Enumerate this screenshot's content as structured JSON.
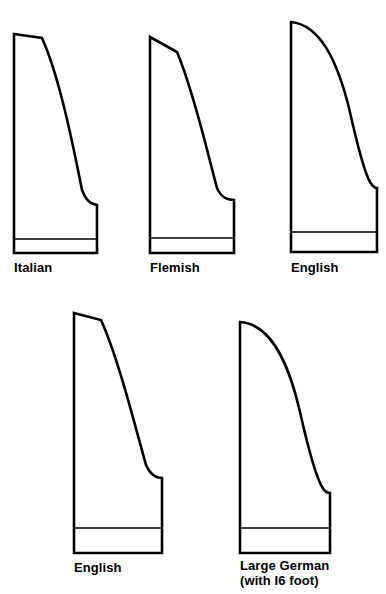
{
  "figure": {
    "background_color": "#ffffff",
    "stroke_color": "#000000",
    "fill_color": "#ffffff",
    "width": 386,
    "height": 594
  },
  "shapes": [
    {
      "id": "italian",
      "label": "Italian",
      "label_line2": "",
      "row": 1,
      "column": 1,
      "label_x": 14,
      "label_y": 272,
      "outline_path": "M 14 34 L 42 38 C 60 78 74 150 82 190 C 86 200 90 204 97 205 L 97 253 L 14 253 Z",
      "keyboard_line": {
        "x1": 14,
        "y1": 239,
        "x2": 97,
        "y2": 239
      },
      "bounds": {
        "left": 14,
        "top": 34,
        "right": 97,
        "bottom": 253
      }
    },
    {
      "id": "flemish",
      "label": "Flemish",
      "label_line2": "",
      "row": 1,
      "column": 2,
      "label_x": 150,
      "label_y": 272,
      "outline_path": "M 150 37 L 177 52 C 194 92 208 155 217 188 C 221 197 226 200 234 200 L 234 253 L 150 253 Z",
      "keyboard_line": {
        "x1": 150,
        "y1": 238,
        "x2": 234,
        "y2": 238
      },
      "bounds": {
        "left": 150,
        "top": 37,
        "right": 234,
        "bottom": 253
      }
    },
    {
      "id": "english-top",
      "label": "English",
      "label_line2": "",
      "row": 1,
      "column": 3,
      "label_x": 291,
      "label_y": 272,
      "outline_path": "M 291 22 C 320 25 337 60 349 108 C 358 148 364 172 370 182 C 373 187 376 188 377 188 L 377 252 L 291 252 Z",
      "keyboard_line": {
        "x1": 291,
        "y1": 232,
        "x2": 377,
        "y2": 232
      },
      "bounds": {
        "left": 291,
        "top": 22,
        "right": 377,
        "bottom": 252
      }
    },
    {
      "id": "english-bottom",
      "label": "English",
      "label_line2": "",
      "row": 2,
      "column": 1,
      "label_x": 74,
      "label_y": 572,
      "outline_path": "M 74 313 L 101 320 C 119 360 136 430 146 465 C 150 474 155 478 162 478 L 162 553 L 74 553 Z",
      "keyboard_line": {
        "x1": 74,
        "y1": 528,
        "x2": 162,
        "y2": 528
      },
      "bounds": {
        "left": 74,
        "top": 313,
        "right": 162,
        "bottom": 553
      }
    },
    {
      "id": "large-german",
      "label": "Large German",
      "label_line2": "(with I6 foot)",
      "row": 2,
      "column": 2,
      "label_x": 240,
      "label_y": 570,
      "outline_path": "M 240 322 C 270 324 288 360 300 412 C 309 452 316 476 322 487 C 325 492 328 493 330 493 L 330 553 L 240 553 Z",
      "keyboard_line": {
        "x1": 240,
        "y1": 528,
        "x2": 330,
        "y2": 528
      },
      "bounds": {
        "left": 240,
        "top": 322,
        "right": 330,
        "bottom": 553
      }
    }
  ]
}
